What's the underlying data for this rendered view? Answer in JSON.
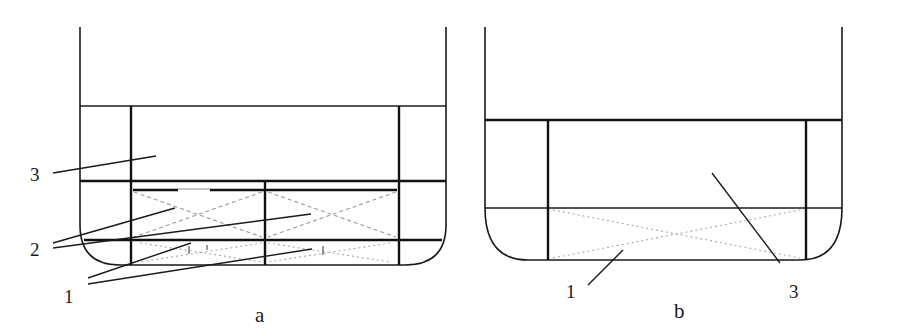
{
  "panels": [
    {
      "id": "a",
      "caption": "a",
      "labels": {
        "label_3": "3",
        "label_2": "2",
        "label_1": "1"
      }
    },
    {
      "id": "b",
      "caption": "b",
      "labels": {
        "label_1": "1",
        "label_3": "3"
      }
    }
  ],
  "colors": {
    "line": "#111111",
    "hidden_line": "#9a9a9a",
    "background": "#ffffff"
  }
}
